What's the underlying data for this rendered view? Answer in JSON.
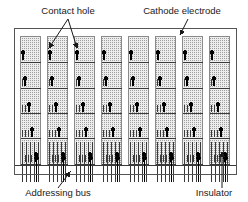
{
  "figure": {
    "width": 248,
    "height": 202,
    "background_color": "#ffffff"
  },
  "labels": {
    "contact_hole": "Contact hole",
    "cathode_electrode": "Cathode electrode",
    "addressing_bus": "Addressing bus",
    "insulator": "Insulator"
  },
  "colors": {
    "line": "#3a3a3a",
    "outer_frame": "#555555",
    "electrode_fill": "#e8e8e8",
    "electrode_stroke": "#8a8a8a",
    "contact_dot": "#000000",
    "text": "#1a1a1a",
    "hatch": "#9a9a9a"
  },
  "structure": {
    "outer_frame": {
      "x": 14,
      "y": 28,
      "width": 222,
      "height": 146
    },
    "column_count": 8,
    "row_count": 5,
    "bus_lines_per_column": 5,
    "column_x_positions": [
      20,
      47,
      74,
      101,
      128,
      155,
      182,
      209
    ],
    "column_width": 20,
    "row_y_positions": [
      36,
      62,
      88,
      113,
      138
    ],
    "row_height": 26,
    "contact_dot_offsets_per_row": [
      2,
      4,
      8,
      11,
      15
    ],
    "stub_counts_per_row": [
      0,
      1,
      3,
      4,
      5
    ]
  },
  "annotations": [
    {
      "name": "contact-hole",
      "label_x": 68,
      "label_y": 14,
      "anchor": "middle"
    },
    {
      "name": "cathode-electrode",
      "label_x": 182,
      "label_y": 14,
      "anchor": "middle"
    },
    {
      "name": "addressing-bus",
      "label_x": 58,
      "label_y": 196,
      "anchor": "middle"
    },
    {
      "name": "insulator",
      "label_x": 214,
      "label_y": 196,
      "anchor": "middle"
    }
  ]
}
